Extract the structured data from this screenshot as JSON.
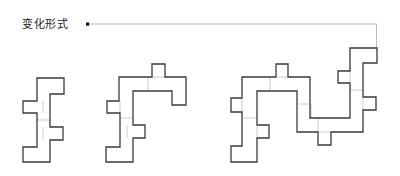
{
  "header": {
    "title": "变化形式"
  },
  "diagram": {
    "variations": [
      {
        "id": 1,
        "label": "",
        "complexity": "single S-shaped column"
      },
      {
        "id": 2,
        "label": "",
        "complexity": "S-shape with top extension"
      },
      {
        "id": 3,
        "label": "",
        "complexity": "extended serpentine with right column"
      }
    ],
    "colors": {
      "outline": "#3a3a3a",
      "guide": "#c8c8c8",
      "leader": "#aaaaaa",
      "marker": "#111111",
      "text": "#222222",
      "background": "#ffffff"
    }
  }
}
